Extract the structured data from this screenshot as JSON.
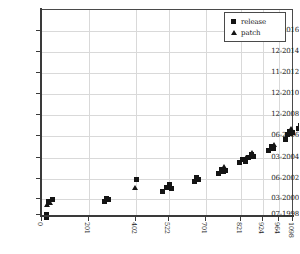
{
  "chart_data": {
    "type": "scatter",
    "title": "",
    "xlabel": "",
    "ylabel": "",
    "grid": true,
    "legend_position": "top-right",
    "xlim": [
      0,
      1130
    ],
    "ylim_labels": [
      "07-1998",
      "03-2000",
      "06-2002",
      "03-2004",
      "06-2006",
      "12-2008",
      "12-2010",
      "11-2012",
      "12-2014",
      "12-2016"
    ],
    "ytick_labels": [
      "12-2016",
      "12-2014",
      "11-2012",
      "12-2010",
      "12-2008",
      "06-2006",
      "03-2004",
      "06-2002",
      "03-2000",
      "07-1998"
    ],
    "xtick_labels": [
      "0",
      "201",
      "402",
      "522",
      "701",
      "821",
      "924",
      "964",
      "1098"
    ],
    "series": [
      {
        "name": "release",
        "marker": "square",
        "color": "#141414",
        "points": [
          [
            4,
            216
          ],
          [
            4,
            213
          ],
          [
            6,
            200
          ],
          [
            10,
            198
          ],
          [
            62,
            200
          ],
          [
            64,
            197
          ],
          [
            66,
            198
          ],
          [
            94,
            178
          ],
          [
            120,
            190
          ],
          [
            124,
            186
          ],
          [
            127,
            183
          ],
          [
            129,
            187
          ],
          [
            152,
            180
          ],
          [
            154,
            176
          ],
          [
            156,
            178
          ],
          [
            176,
            172
          ],
          [
            179,
            168
          ],
          [
            181,
            170
          ],
          [
            183,
            169
          ],
          [
            197,
            161
          ],
          [
            200,
            158
          ],
          [
            203,
            160
          ],
          [
            206,
            156
          ],
          [
            209,
            153
          ],
          [
            211,
            155
          ],
          [
            226,
            149
          ],
          [
            229,
            145
          ],
          [
            231,
            147
          ],
          [
            243,
            138
          ],
          [
            245,
            133
          ],
          [
            247,
            130
          ],
          [
            248,
            132
          ],
          [
            250,
            131
          ],
          [
            256,
            127
          ],
          [
            258,
            124
          ],
          [
            259,
            126
          ],
          [
            262,
            116
          ],
          [
            263,
            112
          ],
          [
            264,
            114
          ],
          [
            266,
            107
          ],
          [
            267,
            104
          ],
          [
            269,
            98
          ],
          [
            270,
            95
          ],
          [
            272,
            88
          ],
          [
            273,
            84
          ],
          [
            275,
            77
          ],
          [
            276,
            74
          ],
          [
            278,
            66
          ],
          [
            281,
            57
          ],
          [
            283,
            49
          ],
          [
            284,
            46
          ],
          [
            287,
            37
          ],
          [
            289,
            28
          ],
          [
            290,
            25
          ],
          [
            292,
            16
          ],
          [
            293,
            13
          ]
        ]
      },
      {
        "name": "patch",
        "marker": "triangle",
        "color": "#141414",
        "points": [
          [
            5,
            204
          ],
          [
            8,
            202
          ],
          [
            93,
            187
          ],
          [
            182,
            166
          ],
          [
            204,
            157
          ],
          [
            210,
            152
          ],
          [
            232,
            144
          ],
          [
            249,
            128
          ],
          [
            260,
            122
          ],
          [
            264,
            110
          ],
          [
            274,
            82
          ],
          [
            285,
            43
          ],
          [
            293,
            9
          ]
        ]
      }
    ]
  },
  "yticks": [
    {
      "label": "12-2016",
      "y": 30
    },
    {
      "label": "12-2014",
      "y": 51
    },
    {
      "label": "11-2012",
      "y": 72
    },
    {
      "label": "12-2010",
      "y": 93
    },
    {
      "label": "12-2008",
      "y": 114
    },
    {
      "label": "06-2006",
      "y": 135
    },
    {
      "label": "03-2004",
      "y": 157
    },
    {
      "label": "06-2002",
      "y": 178
    },
    {
      "label": "03-2000",
      "y": 198
    },
    {
      "label": "07-1998",
      "y": 214
    }
  ],
  "xticks": [
    {
      "label": "0",
      "x": 41
    },
    {
      "label": "201",
      "x": 88
    },
    {
      "label": "402",
      "x": 135
    },
    {
      "label": "522",
      "x": 168
    },
    {
      "label": "701",
      "x": 205
    },
    {
      "label": "821",
      "x": 240
    },
    {
      "label": "924",
      "x": 262
    },
    {
      "label": "964",
      "x": 278
    },
    {
      "label": "1098",
      "x": 292
    }
  ],
  "legend": {
    "entries": [
      {
        "label": "release",
        "marker": "square-marker"
      },
      {
        "label": "patch",
        "marker": "triangle-marker"
      }
    ]
  }
}
